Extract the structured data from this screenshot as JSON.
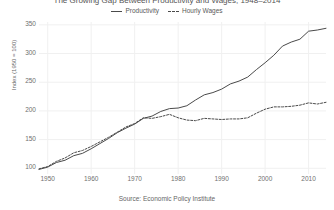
{
  "chart_data": {
    "type": "line",
    "title": "The Growing Gap Between Productivity and Wages, 1948–2014",
    "xlabel": "",
    "ylabel": "Index (1950 = 100)",
    "source": "Source: Economic Policy Institute",
    "xlim": [
      1948,
      2014
    ],
    "ylim": [
      90,
      355
    ],
    "grid": true,
    "legend_position": "top-center",
    "xticks": [
      1950,
      1960,
      1970,
      1980,
      1990,
      2000,
      2010
    ],
    "yticks": [
      100,
      150,
      200,
      250,
      300,
      350
    ],
    "x": [
      1948,
      1950,
      1952,
      1954,
      1956,
      1958,
      1960,
      1962,
      1964,
      1966,
      1968,
      1970,
      1972,
      1974,
      1976,
      1978,
      1980,
      1982,
      1984,
      1986,
      1988,
      1990,
      1992,
      1994,
      1996,
      1998,
      2000,
      2002,
      2004,
      2006,
      2008,
      2010,
      2012,
      2014
    ],
    "series": [
      {
        "name": "Productivity",
        "style": "solid",
        "color": "#4a4a4a",
        "values": [
          98,
          102,
          110,
          114,
          122,
          126,
          134,
          143,
          152,
          162,
          170,
          177,
          187,
          191,
          199,
          204,
          205,
          209,
          219,
          228,
          232,
          238,
          247,
          252,
          259,
          272,
          284,
          297,
          313,
          320,
          325,
          339,
          341,
          344
        ]
      },
      {
        "name": "Hourly Wages",
        "style": "dashed",
        "color": "#4a4a4a",
        "values": [
          99,
          103,
          112,
          118,
          127,
          131,
          138,
          146,
          154,
          163,
          172,
          178,
          188,
          187,
          190,
          194,
          188,
          184,
          183,
          187,
          186,
          185,
          186,
          186,
          188,
          196,
          203,
          207,
          207,
          208,
          210,
          214,
          212,
          215
        ]
      }
    ]
  },
  "legend": {
    "entries": [
      {
        "label": "Productivity"
      },
      {
        "label": "Hourly Wages"
      }
    ]
  },
  "axes": {
    "y_title": "Index (1950 = 100)",
    "y_tick_labels": [
      "350",
      "300",
      "250",
      "200",
      "150",
      "100"
    ],
    "x_tick_labels": [
      "1950",
      "1960",
      "1970",
      "1980",
      "1990",
      "2000",
      "2010"
    ]
  },
  "caption": {
    "source": "Source: Economic Policy Institute"
  },
  "colors": {
    "line": "#4a4a4a",
    "grid": "#f0f0f0",
    "text": "#6f6f6f",
    "background": "#ffffff"
  }
}
